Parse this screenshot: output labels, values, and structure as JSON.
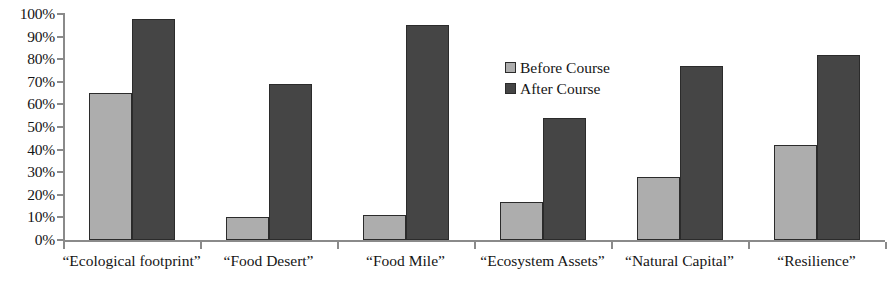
{
  "chart_data": {
    "type": "bar",
    "title": "",
    "xlabel": "",
    "ylabel": "",
    "ylim": [
      0,
      100
    ],
    "y_unit": "%",
    "grid": false,
    "legend_position": "inside-center",
    "categories": [
      "“Ecological footprint”",
      "“Food Desert”",
      "“Food Mile”",
      "“Ecosystem Assets”",
      "“Natural Capital”",
      "“Resilience”"
    ],
    "series": [
      {
        "name": "Before Course",
        "color": "#adadad",
        "values": [
          65,
          10,
          11,
          17,
          28,
          42
        ]
      },
      {
        "name": "After Course",
        "color": "#454545",
        "values": [
          98,
          69,
          95,
          54,
          77,
          82
        ]
      }
    ],
    "y_ticks": [
      "100%",
      "90%",
      "80%",
      "70%",
      "60%",
      "50%",
      "40%",
      "30%",
      "20%",
      "10%",
      "0%"
    ],
    "y_tick_values": [
      100,
      90,
      80,
      70,
      60,
      50,
      40,
      30,
      20,
      10,
      0
    ]
  },
  "legend": {
    "items": [
      {
        "label": "Before Course",
        "swatch": "before"
      },
      {
        "label": "After Course",
        "swatch": "after"
      }
    ]
  },
  "axis_colors": {
    "axis_line": "#8a8a8a",
    "bar_border": "#2b2b2b",
    "text": "#151515"
  }
}
